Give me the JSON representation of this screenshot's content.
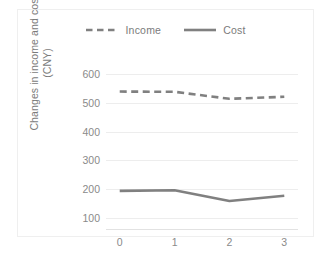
{
  "chart_data": {
    "type": "line",
    "title": "",
    "xlabel": "",
    "ylabel": "Changes in income and cost (CNY)",
    "ylabel_lines": [
      "Changes in income and cost",
      "(CNY)"
    ],
    "x": [
      0,
      1,
      2,
      3
    ],
    "xtick_labels": [
      "0",
      "1",
      "2",
      "3"
    ],
    "ytick_labels": [
      "100",
      "200",
      "300",
      "400",
      "500",
      "600"
    ],
    "yticks": [
      100,
      200,
      300,
      400,
      500,
      600
    ],
    "ylim": [
      60,
      640
    ],
    "xlim": [
      -0.25,
      3.25
    ],
    "grid": true,
    "grid_axis": "y",
    "legend_position": "top-center",
    "series": [
      {
        "name": "Income",
        "values": [
          538,
          537,
          513,
          520
        ],
        "style": "dashed",
        "color": "#808080"
      },
      {
        "name": "Cost",
        "values": [
          195,
          197,
          160,
          178
        ],
        "style": "solid",
        "color": "#808080"
      }
    ]
  },
  "legend": {
    "entries": [
      {
        "label": "Income",
        "swatch": "dashed-line-swatch"
      },
      {
        "label": "Cost",
        "swatch": "solid-line-swatch"
      }
    ]
  },
  "colors": {
    "series_gray": "#808080",
    "gridline": "#ededed",
    "tick_text": "#8a8a8a",
    "legend_text": "#7b7b7b",
    "frame_border": "#efefef",
    "background": "#ffffff",
    "axis_line": "#e2e2e2"
  }
}
